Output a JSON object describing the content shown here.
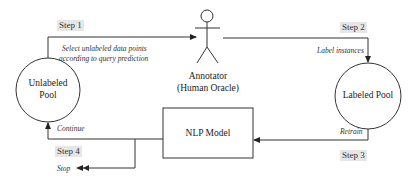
{
  "diagram": {
    "steps": {
      "step1": "Step 1",
      "step2": "Step 2",
      "step3": "Step 3",
      "step4": "Step 4"
    },
    "edges": {
      "select_line1": "Select unlabeled data points",
      "select_line2": "according to query prediction",
      "label_instances": "Label instances",
      "retrain": "Retrain",
      "continue": "Continue",
      "stop": "Stop"
    },
    "nodes": {
      "unlabeled_pool_line1": "Unlabeled",
      "unlabeled_pool_line2": "Pool",
      "annotator_line1": "Annotator",
      "annotator_line2": "(Human Oracle)",
      "labeled_pool": "Labeled Pool",
      "nlp_model": "NLP Model"
    },
    "colors": {
      "line": "#333333",
      "step_bg": "#e6e6e6"
    }
  }
}
